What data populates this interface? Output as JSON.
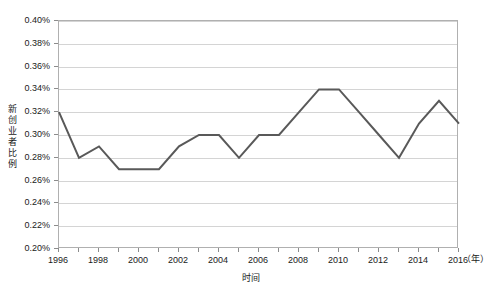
{
  "chart_data": {
    "type": "line",
    "title": "",
    "xlabel": "时间",
    "ylabel": "新创业者比例",
    "x_unit": "（年）",
    "grid": true,
    "legend": "none",
    "xlim": [
      1996,
      2016
    ],
    "ylim": [
      0.2,
      0.4
    ],
    "y_tick_step": 0.02,
    "x_tick_step": 1,
    "x_label_step": 2,
    "y_tick_labels": [
      "0.20%",
      "0.22%",
      "0.24%",
      "0.26%",
      "0.28%",
      "0.30%",
      "0.32%",
      "0.34%",
      "0.36%",
      "0.38%",
      "0.40%"
    ],
    "x_tick_labels": [
      "1996",
      "1998",
      "2000",
      "2002",
      "2004",
      "2006",
      "2008",
      "2010",
      "2012",
      "2014",
      "2016"
    ],
    "x": [
      1996,
      1997,
      1998,
      1999,
      2000,
      2001,
      2002,
      2003,
      2004,
      2005,
      2006,
      2007,
      2008,
      2009,
      2010,
      2011,
      2012,
      2013,
      2014,
      2015,
      2016
    ],
    "series": [
      {
        "name": "新创业者比例",
        "color": "#595959",
        "values": [
          0.32,
          0.28,
          0.29,
          0.27,
          0.27,
          0.27,
          0.29,
          0.3,
          0.3,
          0.28,
          0.3,
          0.3,
          0.32,
          0.34,
          0.34,
          0.32,
          0.3,
          0.28,
          0.31,
          0.33,
          0.31
        ]
      }
    ]
  },
  "colors": {
    "line": "#595959",
    "grid": "#d4d4d4",
    "frame": "#b0b0b0",
    "text": "#1a1a1a",
    "background": "#ffffff"
  }
}
